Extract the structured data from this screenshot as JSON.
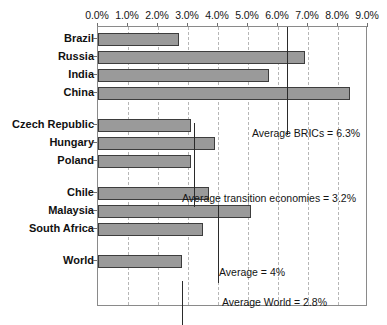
{
  "chart_data": {
    "type": "bar",
    "orientation": "horizontal",
    "title": "",
    "subtitle": "",
    "xlabel": "",
    "ylabel": "",
    "xlim": [
      0,
      9
    ],
    "xunit": "%",
    "grid": true,
    "legend": false,
    "tick_labels": [
      "0.0%",
      "1.0%",
      "2.0%",
      "3.0%",
      "4.0%",
      "5.0%",
      "6.0%",
      "7.0%",
      "8.0%",
      "9.0%"
    ],
    "tick_values": [
      0,
      1,
      2,
      3,
      4,
      5,
      6,
      7,
      8,
      9
    ],
    "groups": [
      {
        "name": "BRICs",
        "categories": [
          "Brazil",
          "Russia",
          "India",
          "China"
        ],
        "values": [
          2.7,
          6.9,
          5.7,
          8.4
        ]
      },
      {
        "name": "Transition economies",
        "categories": [
          "Czech Republic",
          "Hungary",
          "Poland"
        ],
        "values": [
          3.1,
          3.9,
          3.1
        ]
      },
      {
        "name": "Other emerging",
        "categories": [
          "Chile",
          "Malaysia",
          "South Africa"
        ],
        "values": [
          3.7,
          5.1,
          3.5
        ]
      },
      {
        "name": "World",
        "categories": [
          "World"
        ],
        "values": [
          2.8
        ]
      }
    ],
    "categories": [
      "Brazil",
      "Russia",
      "India",
      "China",
      "Czech Republic",
      "Hungary",
      "Poland",
      "Chile",
      "Malaysia",
      "South Africa",
      "World"
    ],
    "values": [
      2.7,
      6.9,
      5.7,
      8.4,
      3.1,
      3.9,
      3.1,
      3.7,
      5.1,
      3.5,
      2.8
    ],
    "reference_lines": [
      {
        "label": "Average BRICs = 6.3%",
        "value": 6.3
      },
      {
        "label": "Average transition economies = 3.2%",
        "value": 3.2
      },
      {
        "label": "Average = 4%",
        "value": 4.0
      },
      {
        "label": "Average World = 2.8%",
        "value": 2.8
      }
    ],
    "colors": {
      "bar_fill": "#9a9a9a",
      "bar_edge": "#3d3d3d",
      "grid": "#b6b6b6",
      "axis": "#6e6e6e",
      "reference_line": "#2b2b2b",
      "background": "#ffffff"
    }
  }
}
